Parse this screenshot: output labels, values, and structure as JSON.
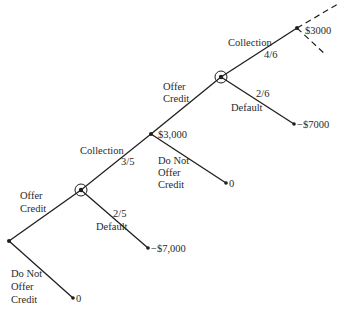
{
  "diagram": {
    "type": "decision-tree",
    "nodes": [
      {
        "id": "root",
        "kind": "decision"
      },
      {
        "id": "chance1",
        "kind": "chance-circled"
      },
      {
        "id": "decision2",
        "kind": "decision",
        "value_label": "$3,000"
      },
      {
        "id": "chance2",
        "kind": "chance-circled"
      },
      {
        "id": "end_collect2",
        "kind": "terminal",
        "value_label": "$3000"
      },
      {
        "id": "end_default2",
        "kind": "terminal",
        "value_label": "−$7000"
      },
      {
        "id": "end_nooffer2",
        "kind": "terminal",
        "value_label": "0"
      },
      {
        "id": "end_default1",
        "kind": "terminal",
        "value_label": "−$7,000"
      },
      {
        "id": "end_nooffer1",
        "kind": "terminal",
        "value_label": "0"
      }
    ],
    "edges": [
      {
        "from": "root",
        "to": "chance1",
        "label": [
          "Offer",
          "Credit"
        ]
      },
      {
        "from": "root",
        "to": "end_nooffer1",
        "label": [
          "Do Not",
          "Offer",
          "Credit"
        ]
      },
      {
        "from": "chance1",
        "to": "decision2",
        "label": [
          "Collection"
        ],
        "probability": "3/5"
      },
      {
        "from": "chance1",
        "to": "end_default1",
        "label": [
          "Default"
        ],
        "probability": "2/5"
      },
      {
        "from": "decision2",
        "to": "chance2",
        "label": [
          "Offer",
          "Credit"
        ]
      },
      {
        "from": "decision2",
        "to": "end_nooffer2",
        "label": [
          "Do Not",
          "Offer",
          "Credit"
        ]
      },
      {
        "from": "chance2",
        "to": "end_collect2",
        "label": [
          "Collection"
        ],
        "probability": "4/6"
      },
      {
        "from": "chance2",
        "to": "end_default2",
        "label": [
          "Default"
        ],
        "probability": "2/6"
      }
    ],
    "continuation": "dashed branches continue beyond $3000 node"
  }
}
